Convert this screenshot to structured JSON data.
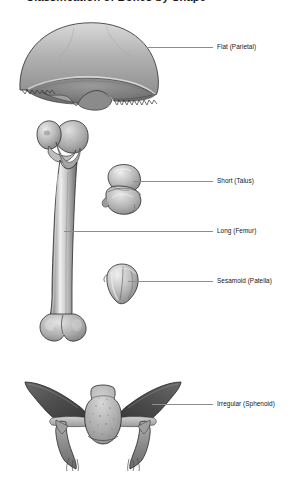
{
  "figure": {
    "title": "Classification of Bones by Shape",
    "background_color": "#ffffff",
    "leader_line_color": "#8d8d8d",
    "label_text_color": "#141414"
  },
  "labels": [
    {
      "id": "flat-parietal",
      "text": "Flat (Parietal)",
      "bone": "parietal",
      "category": "Flat",
      "example": "Parietal"
    },
    {
      "id": "short-talus",
      "text": "Short (Talus)",
      "bone": "talus",
      "category": "Short",
      "example": "Talus"
    },
    {
      "id": "long-femur",
      "text": "Long (Femur)",
      "bone": "femur",
      "category": "Long",
      "example": "Femur"
    },
    {
      "id": "sesamoid-patella",
      "text": "Sesamoid (Patella)",
      "bone": "patella",
      "category": "Sesamoid",
      "example": "Patella"
    },
    {
      "id": "irregular-sphenoid",
      "text": "Irregular (Sphenoid)",
      "bone": "sphenoid",
      "category": "Irregular",
      "example": "Sphenoid"
    }
  ],
  "illustrations": [
    {
      "id": "parietal",
      "name": "parietal-bone-illustration"
    },
    {
      "id": "femur",
      "name": "femur-bone-illustration"
    },
    {
      "id": "talus",
      "name": "talus-bone-illustration"
    },
    {
      "id": "patella",
      "name": "patella-bone-illustration"
    },
    {
      "id": "sphenoid",
      "name": "sphenoid-bone-illustration"
    }
  ]
}
